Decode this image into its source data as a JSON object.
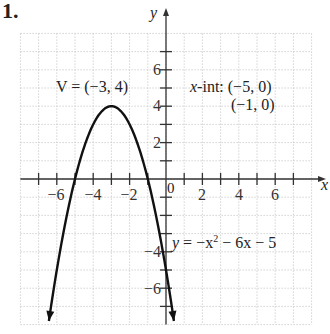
{
  "problem_number": "1.",
  "chart_data": {
    "type": "line",
    "title": "",
    "equation": "y = −x² − 6x − 5",
    "xlabel": "x",
    "ylabel": "y",
    "xlim": [
      -8,
      8
    ],
    "ylim": [
      -8,
      8
    ],
    "grid": true,
    "x_ticks": [
      -6,
      -4,
      -2,
      2,
      4,
      6
    ],
    "y_ticks": [
      -6,
      -4,
      2,
      4,
      6
    ],
    "origin_label": "0",
    "series": [
      {
        "name": "y = -x^2 - 6x - 5",
        "x": [
          -7.3,
          -7,
          -6,
          -5,
          -4,
          -3,
          -2,
          -1,
          0,
          0.3
        ],
        "y": [
          -14.39,
          -12,
          -5,
          0,
          3,
          4,
          3,
          0,
          -5,
          -6.89
        ]
      }
    ],
    "annotations": [
      {
        "text": "V = (−3, 4)",
        "meaning": "vertex",
        "point": [
          -3,
          4
        ]
      },
      {
        "text": "x-int: (−5, 0)",
        "meaning": "x-intercept",
        "point": [
          -5,
          0
        ]
      },
      {
        "text": "(−1, 0)",
        "meaning": "x-intercept",
        "point": [
          -1,
          0
        ]
      }
    ]
  },
  "labels": {
    "vertex": "V = (−3, 4)",
    "xint_prefix": "x",
    "xint_1": "-int: (−5, 0)",
    "xint_2": "(−1, 0)",
    "eq_y": "y",
    "eq_rest": " = −x",
    "eq_sup": "2",
    "eq_tail": " − 6x − 5",
    "x_axis": "x",
    "y_axis": "y",
    "origin": "0",
    "xt": [
      "−6",
      "−4",
      "−2",
      "2",
      "4",
      "6"
    ],
    "yt": [
      "6",
      "4",
      "2",
      "−4",
      "−6"
    ]
  }
}
